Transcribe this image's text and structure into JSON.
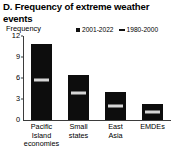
{
  "panel": {
    "label": "D.",
    "title": "D. Frequency of extreme weather events"
  },
  "axis": {
    "y_unit_label": "Frequency",
    "ticks": [
      "0",
      "3",
      "6",
      "9",
      "12"
    ]
  },
  "legend": {
    "items": [
      {
        "label": "2001-2022",
        "marker": "square",
        "color": "#111111"
      },
      {
        "label": "1980-2000",
        "marker": "dash",
        "color": "#111111"
      }
    ]
  },
  "categories": [
    {
      "lines": [
        "Pacific",
        "Island",
        "economies"
      ]
    },
    {
      "lines": [
        "Small",
        "states"
      ]
    },
    {
      "lines": [
        "East",
        "Asia"
      ]
    },
    {
      "lines": [
        "EMDEs"
      ]
    }
  ],
  "chart_data": {
    "type": "bar",
    "title": "D. Frequency of extreme weather events",
    "xlabel": "",
    "ylabel": "Frequency",
    "ylim": [
      0,
      12
    ],
    "yticks": [
      0,
      3,
      6,
      9,
      12
    ],
    "grid": false,
    "legend_position": "top-right",
    "categories": [
      "Pacific Island economies",
      "Small states",
      "East Asia",
      "EMDEs"
    ],
    "series": [
      {
        "name": "2001-2022",
        "type": "bar",
        "color": "#0d0d0d",
        "values": [
          10.8,
          6.5,
          4.0,
          2.3
        ]
      },
      {
        "name": "1980-2000",
        "type": "marker",
        "color": "#d6d6d6",
        "values": [
          5.7,
          3.9,
          2.0,
          1.2
        ]
      }
    ]
  }
}
